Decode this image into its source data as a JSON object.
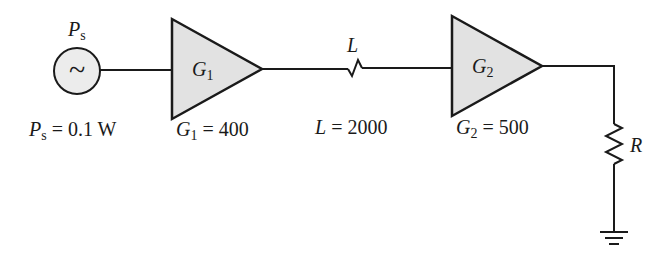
{
  "diagram": {
    "source": {
      "symbol_label": "P",
      "symbol_sub": "s",
      "value_label": "P",
      "value_sub": "s",
      "value_text": " = 0.1 W",
      "glyph": "~"
    },
    "amp1": {
      "label": "G",
      "sub": "1",
      "value_label": "G",
      "value_sub": "1",
      "value_text": " = 400"
    },
    "loss": {
      "label": "L",
      "value_label": "L",
      "value_text": " = 2000"
    },
    "amp2": {
      "label": "G",
      "sub": "2",
      "value_label": "G",
      "value_sub": "2",
      "value_text": " = 500"
    },
    "load": {
      "label": "R"
    },
    "colors": {
      "amp_fill": "#e2e2e2",
      "source_fill": "#ececec",
      "stroke": "#1a1a1a"
    }
  }
}
